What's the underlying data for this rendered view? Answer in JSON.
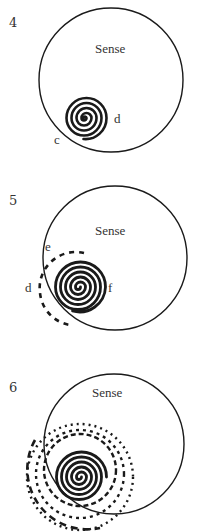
{
  "figure": {
    "colors": {
      "ink": "#1a1a1a",
      "text": "#333333",
      "background": "#ffffff"
    },
    "panels": [
      {
        "number": "4",
        "circle_label": "Sense",
        "point_labels": {
          "c": "c",
          "d": "d"
        }
      },
      {
        "number": "5",
        "circle_label": "Sense",
        "point_labels": {
          "e": "e",
          "d": "d",
          "f": "f"
        }
      },
      {
        "number": "6",
        "circle_label": "Sense"
      }
    ]
  }
}
